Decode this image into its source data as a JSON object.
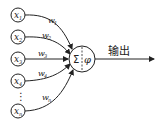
{
  "diagram": {
    "inputs": [
      {
        "symbol": "x",
        "sub": "1",
        "weight": "w",
        "wsub": "1"
      },
      {
        "symbol": "x",
        "sub": "2",
        "weight": "w",
        "wsub": "2"
      },
      {
        "symbol": "x",
        "sub": "3",
        "weight": "w",
        "wsub": "3"
      },
      {
        "symbol": "x",
        "sub": "4",
        "weight": "w",
        "wsub": "4"
      },
      {
        "symbol": "x",
        "sub": "n",
        "weight": "w",
        "wsub": "n"
      }
    ],
    "ellipsis": "⋮",
    "neuron": {
      "sum_symbol": "Σ",
      "activation_symbol": "φ"
    },
    "output_label": "输出",
    "colors": {
      "stroke": "#222222",
      "background": "#ffffff"
    }
  }
}
